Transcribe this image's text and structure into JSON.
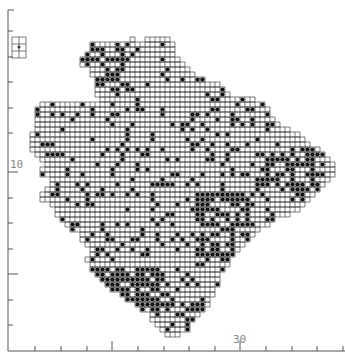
{
  "figure": {
    "type": "grid distribution map",
    "grid_cell_px": 5,
    "line_color": "#222222",
    "dot_color": "#111111",
    "axis_color": "#555555"
  },
  "axes": {
    "left": {
      "x": 8,
      "y_start": 10,
      "y_end": 351,
      "ticks_y": [
        31,
        57,
        82,
        108,
        133,
        172,
        198,
        223,
        249,
        274,
        300,
        325
      ],
      "major_ticks_y": [
        172,
        274
      ],
      "label": "10",
      "label_y": 158
    },
    "bottom": {
      "y": 351,
      "x_start": 8,
      "x_end": 345,
      "ticks_x": [
        35,
        61,
        87,
        112,
        138,
        164,
        189,
        215,
        240,
        266,
        292,
        317,
        343
      ],
      "major_ticks_x": [
        112,
        240
      ],
      "label": "30",
      "label_x": 233
    }
  },
  "inset": {
    "x": 12,
    "y": 37,
    "w": 14,
    "h": 21,
    "label": "scale key"
  },
  "map_rows": [
    [
      37,
      131,
      136
    ],
    [
      37,
      147,
      172
    ],
    [
      42,
      92,
      176
    ],
    [
      47,
      92,
      176
    ],
    [
      52,
      85,
      176
    ],
    [
      57,
      82,
      178
    ],
    [
      62,
      82,
      186
    ],
    [
      67,
      90,
      191
    ],
    [
      72,
      92,
      196
    ],
    [
      77,
      95,
      206
    ],
    [
      82,
      97,
      219
    ],
    [
      87,
      95,
      224
    ],
    [
      92,
      95,
      229
    ],
    [
      97,
      100,
      254
    ],
    [
      102,
      40,
      264
    ],
    [
      107,
      37,
      269
    ],
    [
      112,
      37,
      272
    ],
    [
      117,
      35,
      274
    ],
    [
      122,
      35,
      282
    ],
    [
      127,
      35,
      292
    ],
    [
      132,
      32,
      300
    ],
    [
      137,
      32,
      305
    ],
    [
      142,
      30,
      312
    ],
    [
      147,
      30,
      318
    ],
    [
      152,
      35,
      325
    ],
    [
      157,
      40,
      330
    ],
    [
      162,
      45,
      336
    ],
    [
      167,
      40,
      336
    ],
    [
      172,
      40,
      334
    ],
    [
      177,
      50,
      328
    ],
    [
      182,
      52,
      324
    ],
    [
      187,
      45,
      318
    ],
    [
      192,
      40,
      316
    ],
    [
      197,
      42,
      312
    ],
    [
      202,
      50,
      305
    ],
    [
      207,
      55,
      298
    ],
    [
      212,
      57,
      288
    ],
    [
      217,
      60,
      276
    ],
    [
      222,
      65,
      268
    ],
    [
      227,
      70,
      262
    ],
    [
      232,
      80,
      255
    ],
    [
      237,
      82,
      250
    ],
    [
      242,
      85,
      245
    ],
    [
      247,
      90,
      240
    ],
    [
      252,
      88,
      236
    ],
    [
      257,
      87,
      232
    ],
    [
      262,
      88,
      228
    ],
    [
      267,
      92,
      225
    ],
    [
      272,
      95,
      222
    ],
    [
      277,
      100,
      220
    ],
    [
      282,
      107,
      218
    ],
    [
      287,
      112,
      216
    ],
    [
      292,
      118,
      214
    ],
    [
      297,
      125,
      212
    ],
    [
      302,
      135,
      210
    ],
    [
      307,
      140,
      206
    ],
    [
      312,
      148,
      202
    ],
    [
      317,
      152,
      196
    ],
    [
      322,
      155,
      192
    ],
    [
      327,
      160,
      188
    ],
    [
      332,
      165,
      180
    ]
  ],
  "dense_zones": [
    {
      "x": 80,
      "y": 40,
      "w": 50,
      "h": 50,
      "density": 0.45
    },
    {
      "x": 90,
      "y": 265,
      "w": 75,
      "h": 40,
      "density": 0.8
    },
    {
      "x": 195,
      "y": 190,
      "w": 55,
      "h": 70,
      "density": 0.6
    },
    {
      "x": 255,
      "y": 150,
      "w": 70,
      "h": 40,
      "density": 0.55
    },
    {
      "x": 150,
      "y": 290,
      "w": 60,
      "h": 40,
      "density": 0.35
    }
  ],
  "base_density": 0.16
}
